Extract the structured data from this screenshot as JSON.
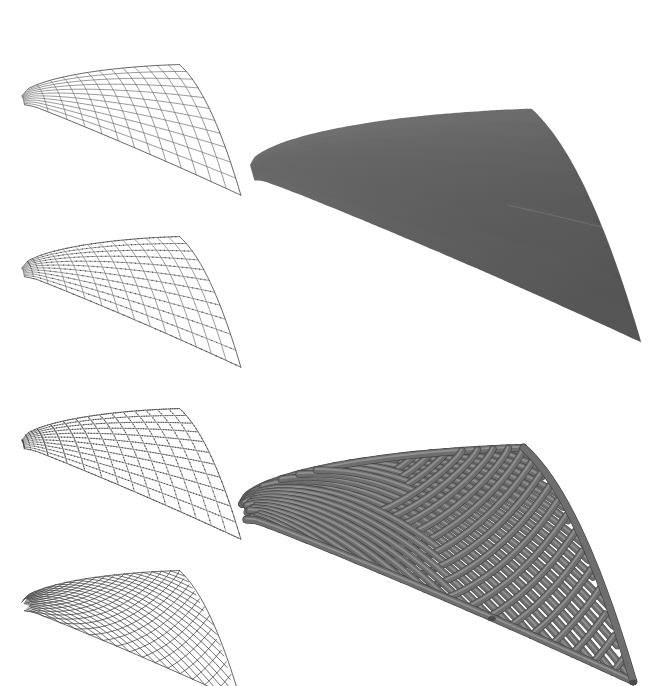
{
  "figure": {
    "background_color": "#ffffff",
    "width": 657,
    "height": 680,
    "panel_count": 6
  },
  "palette": {
    "background": "#ffffff",
    "wire_light": "#8a8a8a",
    "wire_mid": "#6d6d6d",
    "wire_dark": "#3d3d3d",
    "node_marker": "#444444",
    "surface_fill_light": "#6b6b6b",
    "surface_fill_dark": "#585858",
    "tube_fill": "#6e6e6e",
    "tube_shadow": "#4f4f4f",
    "tube_highlight": "#8d8d8d"
  },
  "panels": [
    {
      "id": "panel-quad-mesh",
      "name": "quad-mesh-wireframe",
      "label": "Quadrilateral mesh wireframe",
      "column": "left",
      "row": 1,
      "bounds": {
        "x": 14,
        "y": 8,
        "width": 232,
        "height": 165
      },
      "style": "wireframe-quads",
      "u_divisions": 13,
      "v_divisions": 11,
      "show_nodes": false,
      "stroke": "#6d6d6d"
    },
    {
      "id": "panel-quad-mesh-nodes",
      "name": "quad-mesh-with-node-markers",
      "label": "Mesh with subdivision node markers",
      "column": "left",
      "row": 2,
      "bounds": {
        "x": 14,
        "y": 180,
        "width": 232,
        "height": 165
      },
      "style": "wireframe-quads-dotted",
      "u_divisions": 13,
      "v_divisions": 11,
      "show_nodes": true,
      "node_density": 3,
      "stroke": "#8a8a8a"
    },
    {
      "id": "panel-quad-mesh-dense-nodes",
      "name": "quad-mesh-dense-node-markers",
      "label": "Mesh with dense node markers",
      "column": "left",
      "row": 3,
      "bounds": {
        "x": 14,
        "y": 352,
        "width": 232,
        "height": 165
      },
      "style": "wireframe-quads-dotted",
      "u_divisions": 13,
      "v_divisions": 11,
      "show_nodes": true,
      "node_density": 5,
      "stroke": "#7a7a7a"
    },
    {
      "id": "panel-diagrid",
      "name": "diagrid-lattice-wireframe",
      "label": "Diagrid lattice wireframe",
      "column": "left",
      "row": 4,
      "bounds": {
        "x": 14,
        "y": 514,
        "width": 232,
        "height": 165
      },
      "style": "wireframe-diagrid",
      "u_divisions": 16,
      "v_divisions": 13,
      "show_nodes": false,
      "stroke": "#3d3d3d"
    },
    {
      "id": "panel-solid-surface",
      "name": "shaded-solid-surface",
      "label": "Shaded continuous surface render",
      "column": "right",
      "row": 1,
      "bounds": {
        "x": 250,
        "y": 14,
        "width": 392,
        "height": 290
      },
      "style": "solid-shaded",
      "fill_from": "#747474",
      "fill_to": "#585858"
    },
    {
      "id": "panel-gridshell-render",
      "name": "gridshell-3d-render",
      "label": "Rendered tubular gridshell structure",
      "column": "right",
      "row": 2,
      "bounds": {
        "x": 240,
        "y": 362,
        "width": 400,
        "height": 312
      },
      "style": "solid-tubes",
      "u_divisions": 17,
      "v_divisions": 13,
      "tube_radius": 3.1
    }
  ],
  "surface": {
    "type": "hyperbolic-paraboloid-saddle",
    "description": "Anticlastic saddle shell with one cantilevered tip and one flared edge",
    "control_tips": {
      "left_tip": "sharp cantilever point",
      "top_ridge": "high arch crown",
      "right_corner": "flared open edge",
      "bottom_corner": "low drop corner"
    }
  },
  "geometry": {
    "wire_left": {
      "tip": [
        22,
        78
      ],
      "crown": [
        110,
        14
      ],
      "ridge_end": [
        186,
        32
      ],
      "right_top": [
        236,
        84
      ],
      "right_bottom": [
        185,
        134
      ],
      "valley": [
        128,
        104
      ],
      "drop": [
        120,
        168
      ]
    },
    "solid": {
      "tip": [
        251,
        128
      ],
      "crown": [
        452,
        16
      ],
      "right_corner": [
        639,
        128
      ],
      "bottom_tip": [
        494,
        299
      ],
      "valley": [
        418,
        122
      ],
      "inner_low": [
        372,
        96
      ]
    },
    "render": {
      "tip": [
        246,
        496
      ],
      "crown": [
        430,
        368
      ],
      "right_corner": [
        588,
        600
      ],
      "bottom_tip": [
        470,
        672
      ],
      "valley": [
        398,
        470
      ]
    }
  },
  "annotations": {
    "visible_text": [],
    "captions": [],
    "axis_labels": []
  }
}
